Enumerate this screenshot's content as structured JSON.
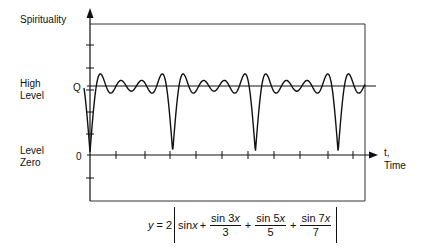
{
  "labels": {
    "y_axis_title": "Spirituality",
    "high_level_line1": "High",
    "high_level_line2": "Level",
    "level_zero_line1": "Level",
    "level_zero_line2": "Zero",
    "q_tick": "Q",
    "zero_tick": "0",
    "x_axis_line1": "t,",
    "x_axis_line2": "Time"
  },
  "formula": {
    "lhs": "y",
    "eq": "= 2",
    "term1": "sin",
    "term1_var": "x",
    "plus1": "+",
    "frac1_num": "sin 3",
    "frac1_var": "x",
    "frac1_den": "3",
    "plus2": "+",
    "frac2_num": "sin 5",
    "frac2_var": "x",
    "frac2_den": "5",
    "plus3": "+",
    "frac3_num": "sin 7",
    "frac3_var": "x",
    "frac3_den": "7"
  },
  "colors": {
    "ink": "#111111",
    "background": "#ffffff"
  },
  "chart_data": {
    "type": "line",
    "title": "",
    "xlabel": "t, Time",
    "ylabel": "Spirituality",
    "series": [
      {
        "name": "y = 2|sin x + sin3x/3 + sin5x/5 + sin7x/7|",
        "function": "2*abs(sin(x)+sin(3x)/3+sin(5x)/5+sin(7x)/7)"
      }
    ],
    "reference_lines": [
      {
        "label": "Q",
        "level": "High Level"
      },
      {
        "label": "0",
        "level": "Level Zero"
      }
    ],
    "dips_at_periods": 4,
    "grid": false
  }
}
